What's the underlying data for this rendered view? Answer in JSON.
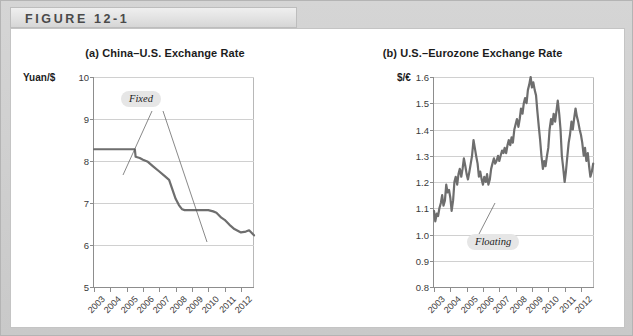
{
  "figure": {
    "header_label": "FIGURE 12-1"
  },
  "charts": [
    {
      "id": "chart-a",
      "title": "(a) China–U.S. Exchange Rate",
      "y_unit": "Yuan/$",
      "annotation": "Fixed"
    },
    {
      "id": "chart-b",
      "title": "(b) U.S.–Eurozone Exchange Rate",
      "y_unit": "$/€",
      "annotation": "Floating"
    }
  ],
  "chart_data": [
    {
      "type": "line",
      "title": "(a) China–U.S. Exchange Rate",
      "xlabel": "",
      "ylabel": "Yuan/$",
      "ylim": [
        5,
        10
      ],
      "yticks": [
        5,
        6,
        7,
        8,
        9,
        10
      ],
      "ytick_labels": [
        "5",
        "6",
        "7",
        "8",
        "9",
        "10"
      ],
      "xlim": [
        2003,
        2012.8
      ],
      "xticks": [
        2003,
        2004,
        2005,
        2006,
        2007,
        2008,
        2009,
        2010,
        2011,
        2012
      ],
      "xtick_labels": [
        "2003",
        "2004",
        "2005",
        "2006",
        "2007",
        "2008",
        "2009",
        "2010",
        "2011",
        "2012"
      ],
      "grid": true,
      "legend": "none",
      "annotations": [
        {
          "text": "Fixed",
          "points_to": [
            "2004.3 at 8.28 (fixed peg segment)",
            "2009.2 at 6.83 (re-pegged segment)"
          ]
        }
      ],
      "series": [
        {
          "name": "Yuan per U.S. dollar",
          "color": "#6e6e6e",
          "x": [
            2003.0,
            2003.5,
            2004.0,
            2004.5,
            2005.0,
            2005.5,
            2005.55,
            2005.8,
            2006.0,
            2006.3,
            2006.6,
            2007.0,
            2007.3,
            2007.6,
            2008.0,
            2008.2,
            2008.4,
            2008.55,
            2008.7,
            2009.0,
            2009.5,
            2010.0,
            2010.3,
            2010.5,
            2010.8,
            2011.0,
            2011.3,
            2011.6,
            2012.0,
            2012.3,
            2012.5,
            2012.8
          ],
          "y": [
            8.28,
            8.28,
            8.28,
            8.28,
            8.28,
            8.28,
            8.1,
            8.07,
            8.03,
            7.98,
            7.88,
            7.75,
            7.65,
            7.55,
            7.1,
            6.95,
            6.85,
            6.83,
            6.83,
            6.83,
            6.83,
            6.83,
            6.8,
            6.77,
            6.65,
            6.6,
            6.48,
            6.38,
            6.3,
            6.32,
            6.35,
            6.23
          ]
        }
      ]
    },
    {
      "type": "line",
      "title": "(b) U.S.–Eurozone Exchange Rate",
      "xlabel": "",
      "ylabel": "$/€",
      "ylim": [
        0.8,
        1.6
      ],
      "yticks": [
        0.8,
        0.9,
        1.0,
        1.1,
        1.2,
        1.3,
        1.4,
        1.5,
        1.6
      ],
      "ytick_labels": [
        "0.8",
        "0.9",
        "1.0",
        "1.1",
        "1.2",
        "1.3",
        "1.4",
        "1.5",
        "1.6"
      ],
      "xlim": [
        2003,
        2012.8
      ],
      "xticks": [
        2003,
        2004,
        2005,
        2006,
        2007,
        2008,
        2009,
        2010,
        2011,
        2012
      ],
      "xtick_labels": [
        "2003",
        "2004",
        "2005",
        "2006",
        "2007",
        "2008",
        "2009",
        "2010",
        "2011",
        "2012"
      ],
      "grid": true,
      "legend": "none",
      "annotations": [
        {
          "text": "Floating",
          "points_to": [
            "2005.9 at 1.20 (volatile floating path)"
          ]
        }
      ],
      "series": [
        {
          "name": "U.S. dollars per euro",
          "color": "#6e6e6e",
          "x": [
            2003.0,
            2003.08,
            2003.17,
            2003.25,
            2003.33,
            2003.42,
            2003.5,
            2003.58,
            2003.67,
            2003.75,
            2003.83,
            2003.92,
            2004.0,
            2004.08,
            2004.17,
            2004.25,
            2004.33,
            2004.42,
            2004.5,
            2004.58,
            2004.67,
            2004.75,
            2004.83,
            2004.92,
            2005.0,
            2005.08,
            2005.17,
            2005.25,
            2005.33,
            2005.42,
            2005.5,
            2005.58,
            2005.67,
            2005.75,
            2005.83,
            2005.92,
            2006.0,
            2006.08,
            2006.17,
            2006.25,
            2006.33,
            2006.42,
            2006.5,
            2006.58,
            2006.67,
            2006.75,
            2006.83,
            2006.92,
            2007.0,
            2007.08,
            2007.17,
            2007.25,
            2007.33,
            2007.42,
            2007.5,
            2007.58,
            2007.67,
            2007.75,
            2007.83,
            2007.92,
            2008.0,
            2008.08,
            2008.17,
            2008.25,
            2008.33,
            2008.42,
            2008.5,
            2008.58,
            2008.67,
            2008.75,
            2008.83,
            2008.92,
            2009.0,
            2009.08,
            2009.17,
            2009.25,
            2009.33,
            2009.42,
            2009.5,
            2009.58,
            2009.67,
            2009.75,
            2009.83,
            2009.92,
            2010.0,
            2010.08,
            2010.17,
            2010.25,
            2010.33,
            2010.42,
            2010.5,
            2010.58,
            2010.67,
            2010.75,
            2010.83,
            2010.92,
            2011.0,
            2011.08,
            2011.17,
            2011.25,
            2011.33,
            2011.42,
            2011.5,
            2011.58,
            2011.67,
            2011.75,
            2011.83,
            2011.92,
            2012.0,
            2012.08,
            2012.17,
            2012.25,
            2012.33,
            2012.42,
            2012.5,
            2012.58,
            2012.67,
            2012.75
          ],
          "y": [
            1.09,
            1.05,
            1.08,
            1.07,
            1.1,
            1.12,
            1.15,
            1.11,
            1.13,
            1.19,
            1.16,
            1.17,
            1.14,
            1.09,
            1.13,
            1.2,
            1.22,
            1.19,
            1.23,
            1.25,
            1.22,
            1.25,
            1.29,
            1.26,
            1.23,
            1.21,
            1.24,
            1.27,
            1.3,
            1.36,
            1.33,
            1.3,
            1.27,
            1.22,
            1.24,
            1.21,
            1.19,
            1.22,
            1.2,
            1.23,
            1.19,
            1.21,
            1.25,
            1.27,
            1.29,
            1.27,
            1.28,
            1.3,
            1.28,
            1.3,
            1.32,
            1.31,
            1.33,
            1.31,
            1.34,
            1.36,
            1.34,
            1.37,
            1.35,
            1.4,
            1.42,
            1.44,
            1.41,
            1.44,
            1.48,
            1.46,
            1.5,
            1.52,
            1.5,
            1.55,
            1.57,
            1.6,
            1.56,
            1.58,
            1.55,
            1.53,
            1.47,
            1.41,
            1.36,
            1.3,
            1.25,
            1.28,
            1.26,
            1.3,
            1.33,
            1.4,
            1.44,
            1.42,
            1.46,
            1.43,
            1.47,
            1.51,
            1.46,
            1.4,
            1.3,
            1.25,
            1.2,
            1.24,
            1.3,
            1.35,
            1.38,
            1.43,
            1.4,
            1.44,
            1.48,
            1.45,
            1.43,
            1.4,
            1.38,
            1.35,
            1.3,
            1.33,
            1.28,
            1.31,
            1.26,
            1.22,
            1.24,
            1.27,
            1.3,
            1.32
          ]
        }
      ]
    }
  ]
}
